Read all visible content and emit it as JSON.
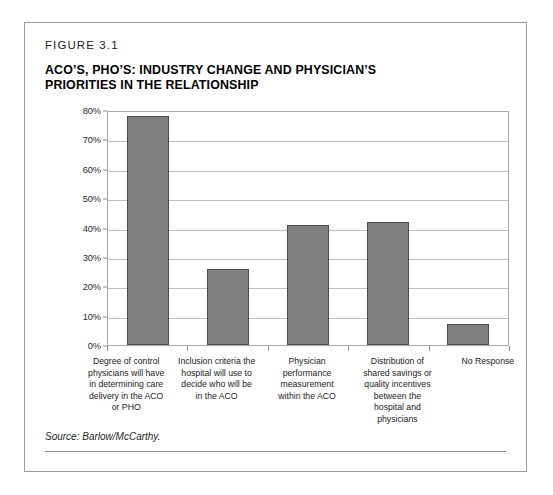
{
  "figure": {
    "label": "FIGURE 3.1",
    "title_line1": "ACO’S, PHO’S: INDUSTRY CHANGE AND PHYSICIAN’S",
    "title_line2": "PRIORITIES IN THE RELATIONSHIP",
    "source": "Source: Barlow/McCarthy."
  },
  "colors": {
    "bar_fill": "#808080",
    "bar_border": "#4c4c4c",
    "gridline": "#bfbfbf",
    "frame": "#9a9a9a",
    "text": "#1a1a1a"
  },
  "chart_data": {
    "type": "bar",
    "title": "ACO’S, PHO’S: INDUSTRY CHANGE AND PHYSICIAN’S PRIORITIES IN THE RELATIONSHIP",
    "xlabel": "",
    "ylabel": "",
    "ylim": [
      0,
      80
    ],
    "grid": true,
    "legend": false,
    "ytick_labels": [
      "80%",
      "70%",
      "60%",
      "50%",
      "40%",
      "30%",
      "20%",
      "10%",
      "0%"
    ],
    "ytick_values": [
      80,
      70,
      60,
      50,
      40,
      30,
      20,
      10,
      0
    ],
    "categories": [
      "Degree of control physicians will have in determining care delivery in the ACO or PHO",
      "Inclusion criteria the hospital will use to decide who will be in the ACO",
      "Physician performance measurement within the ACO",
      "Distribution of shared savings or quality incentives between the hospital and physicians",
      "No Response"
    ],
    "category_lines": [
      [
        "Degree of control",
        "physicians will have",
        "in determining care",
        "delivery in the ACO",
        "or PHO"
      ],
      [
        "Inclusion criteria the",
        "hospital will use to",
        "decide who will be",
        "in the ACO"
      ],
      [
        "Physician",
        "performance",
        "measurement",
        "within the ACO"
      ],
      [
        "Distribution of",
        "shared savings or",
        "quality incentives",
        "between the",
        "hospital and",
        "physicians"
      ],
      [
        "No Response"
      ]
    ],
    "values": [
      78,
      26,
      41,
      42,
      7
    ]
  }
}
